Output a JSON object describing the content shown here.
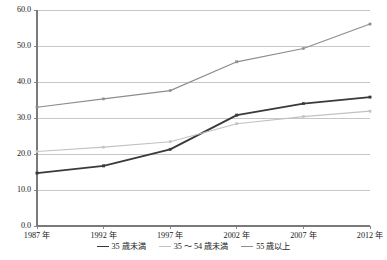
{
  "chart_data": {
    "type": "line",
    "title": "",
    "xlabel": "",
    "ylabel": "",
    "ylim": [
      0,
      60
    ],
    "ytick_step": 10,
    "grid": true,
    "legend_position": "bottom",
    "categories": [
      "1987 年",
      "1992 年",
      "1997 年",
      "2002 年",
      "2007 年",
      "2012 年"
    ],
    "ytick_labels": [
      "60.0",
      "50.0",
      "40.0",
      "30.0",
      "20.0",
      "10.0",
      "0.0"
    ],
    "series": [
      {
        "name": "35 歳未満",
        "color": "#3a3a3a",
        "values": [
          14.7,
          16.7,
          21.3,
          30.8,
          34.0,
          35.8
        ]
      },
      {
        "name": "35 ～ 54 歳未満",
        "color": "#c2c2c2",
        "values": [
          20.7,
          21.9,
          23.4,
          28.4,
          30.4,
          31.9
        ]
      },
      {
        "name": "55 歳以上",
        "color": "#8d8d8d",
        "values": [
          33.0,
          35.3,
          37.6,
          45.6,
          49.3,
          56.1
        ]
      }
    ]
  },
  "colors": {
    "background": "#ffffff",
    "grid": "#b9b9b9",
    "axis": "#7a7a7a",
    "text": "#1a1a1a"
  }
}
